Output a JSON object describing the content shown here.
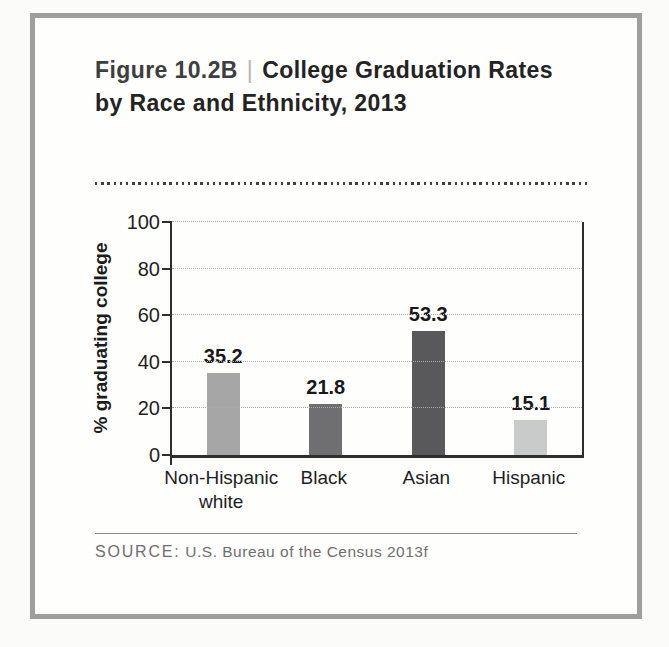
{
  "figure": {
    "label": "Figure 10.2B",
    "divider": "|",
    "title": "College Graduation Rates by Race and Ethnicity, 2013"
  },
  "source": {
    "prefix": "SOURCE:",
    "text": "U.S. Bureau of the Census 2013f"
  },
  "colors": {
    "frame_border": "#9e9e9e",
    "axis": "#2e2e2e",
    "gridline": "#ababab"
  },
  "chart_data": {
    "type": "bar",
    "title": "College Graduation Rates by Race and Ethnicity, 2013",
    "categories": [
      "Non-Hispanic\nwhite",
      "Black",
      "Asian",
      "Hispanic"
    ],
    "values": [
      35.2,
      21.8,
      53.3,
      15.1
    ],
    "value_labels": [
      "35.2",
      "21.8",
      "53.3",
      "15.1"
    ],
    "bar_colors": [
      "#a6a6a6",
      "#6f6f71",
      "#59595b",
      "#c9cbca"
    ],
    "xlabel": "",
    "ylabel": "% graduating college",
    "ylim": [
      0,
      100
    ],
    "yticks": [
      0,
      20,
      40,
      60,
      80,
      100
    ],
    "grid": true,
    "legend": false
  }
}
